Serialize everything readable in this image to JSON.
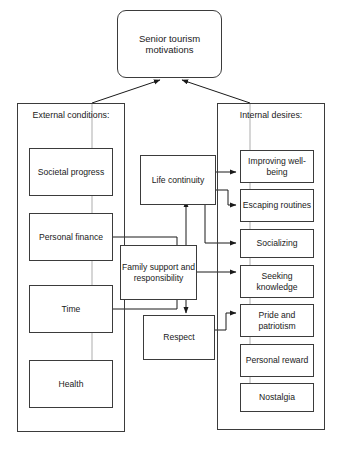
{
  "diagram": {
    "title": "Senior tourism motivations",
    "root": {
      "label": "Senior tourism motivations"
    },
    "panels": [
      {
        "id": "external",
        "title": "External conditions:",
        "items": [
          {
            "label": "Societal progress"
          },
          {
            "label": "Personal finance"
          },
          {
            "label": "Time"
          },
          {
            "label": "Health"
          }
        ]
      },
      {
        "id": "internal",
        "title": "Internal desires:",
        "items": [
          {
            "label": "Improving well-being"
          },
          {
            "label": "Escaping routines"
          },
          {
            "label": "Socializing"
          },
          {
            "label": "Seeking knowledge"
          },
          {
            "label": "Pride and patriotism"
          },
          {
            "label": "Personal reward"
          },
          {
            "label": "Nostalgia"
          }
        ]
      }
    ],
    "mediators": [
      {
        "id": "life-continuity",
        "label": "Life continuity"
      },
      {
        "id": "family-support",
        "label": "Family support and responsibility"
      },
      {
        "id": "respect",
        "label": "Respect"
      }
    ],
    "colors": {
      "stroke": "#3b3b3b",
      "text": "#1a1a1a",
      "background": "#ffffff"
    }
  }
}
